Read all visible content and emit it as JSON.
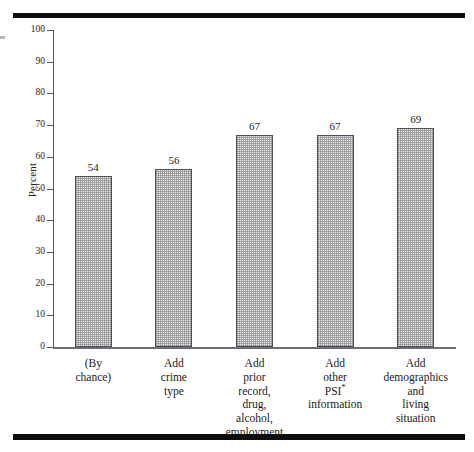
{
  "figure": {
    "rule_color": "#0d0d0d",
    "background": "#ffffff"
  },
  "chart_data": {
    "type": "bar",
    "title": "",
    "subtitle": "",
    "xlabel": "",
    "ylabel": "Percent",
    "ylim": [
      0,
      100
    ],
    "ytick_step": 10,
    "yticks": [
      "100",
      "90",
      "80",
      "70",
      "60",
      "50",
      "40",
      "30",
      "20",
      "10",
      "0"
    ],
    "grid": false,
    "legend": false,
    "categories": [
      "(By\nchance)",
      "Add\ncrime\ntype",
      "Add\nprior\nrecord,\ndrug,\nalcohol,\nemployment",
      "Add\nother\nPSI*\ninformation",
      "Add\ndemographics\nand\nliving\nsituation"
    ],
    "values": [
      54,
      56,
      67,
      67,
      69
    ],
    "value_labels": [
      "54",
      "56",
      "67",
      "67",
      "69"
    ],
    "bar_fill": "#e8e8e8",
    "bar_edge": "#4d5155",
    "footnote_marker": "*"
  }
}
